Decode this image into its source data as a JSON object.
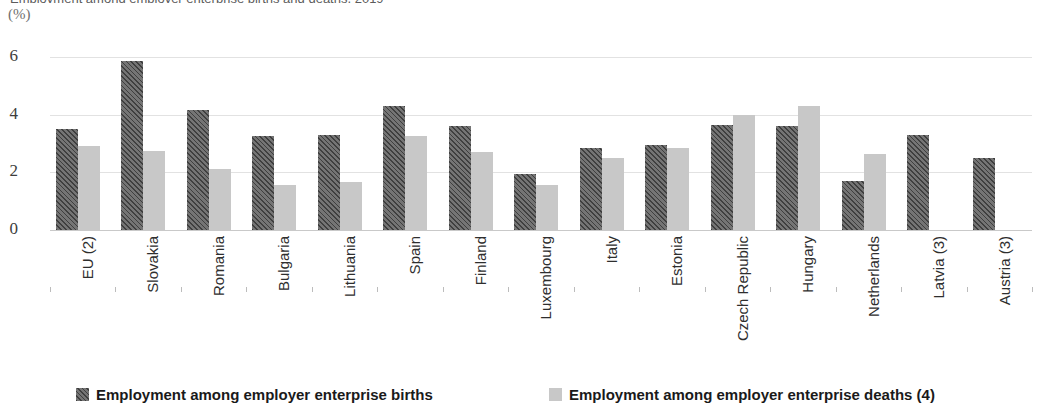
{
  "axis_unit_label": "(%)",
  "title_sliver": "Employment among employer enterprise births and deaths, 2019",
  "colors": {
    "births": "#5a5a5a",
    "deaths": "#c8c8c8",
    "gridline": "#e2e2e2",
    "axis_text": "#3d3d3d"
  },
  "legend": {
    "items": [
      {
        "label": "Employment among employer enterprise births",
        "key": "births"
      },
      {
        "label": "Employment among employer enterprise deaths (4)",
        "key": "deaths"
      }
    ]
  },
  "chart_data": {
    "type": "bar",
    "title": "Employment among employer enterprise births and deaths, 2019",
    "xlabel": "",
    "ylabel": "(%)",
    "ylim": [
      0,
      6
    ],
    "yticks": [
      0,
      2,
      4,
      6
    ],
    "grid": true,
    "legend_position": "bottom",
    "categories": [
      "EU (2)",
      "Slovakia",
      "Romania",
      "Bulgaria",
      "Lithuania",
      "Spain",
      "Finland",
      "Luxembourg",
      "Italy",
      "Estonia",
      "Czech Republic",
      "Hungary",
      "Netherlands",
      "Latvia (3)",
      "Austria (3)"
    ],
    "series": [
      {
        "name": "Employment among employer enterprise births",
        "values": [
          3.5,
          5.85,
          4.15,
          3.25,
          3.3,
          4.3,
          3.6,
          1.95,
          2.85,
          2.95,
          3.65,
          3.6,
          1.7,
          3.3,
          2.5
        ]
      },
      {
        "name": "Employment among employer enterprise deaths (4)",
        "values": [
          2.9,
          2.75,
          2.1,
          1.55,
          1.65,
          3.25,
          2.7,
          1.55,
          2.5,
          2.85,
          4.0,
          4.3,
          2.65,
          null,
          null
        ]
      }
    ]
  }
}
